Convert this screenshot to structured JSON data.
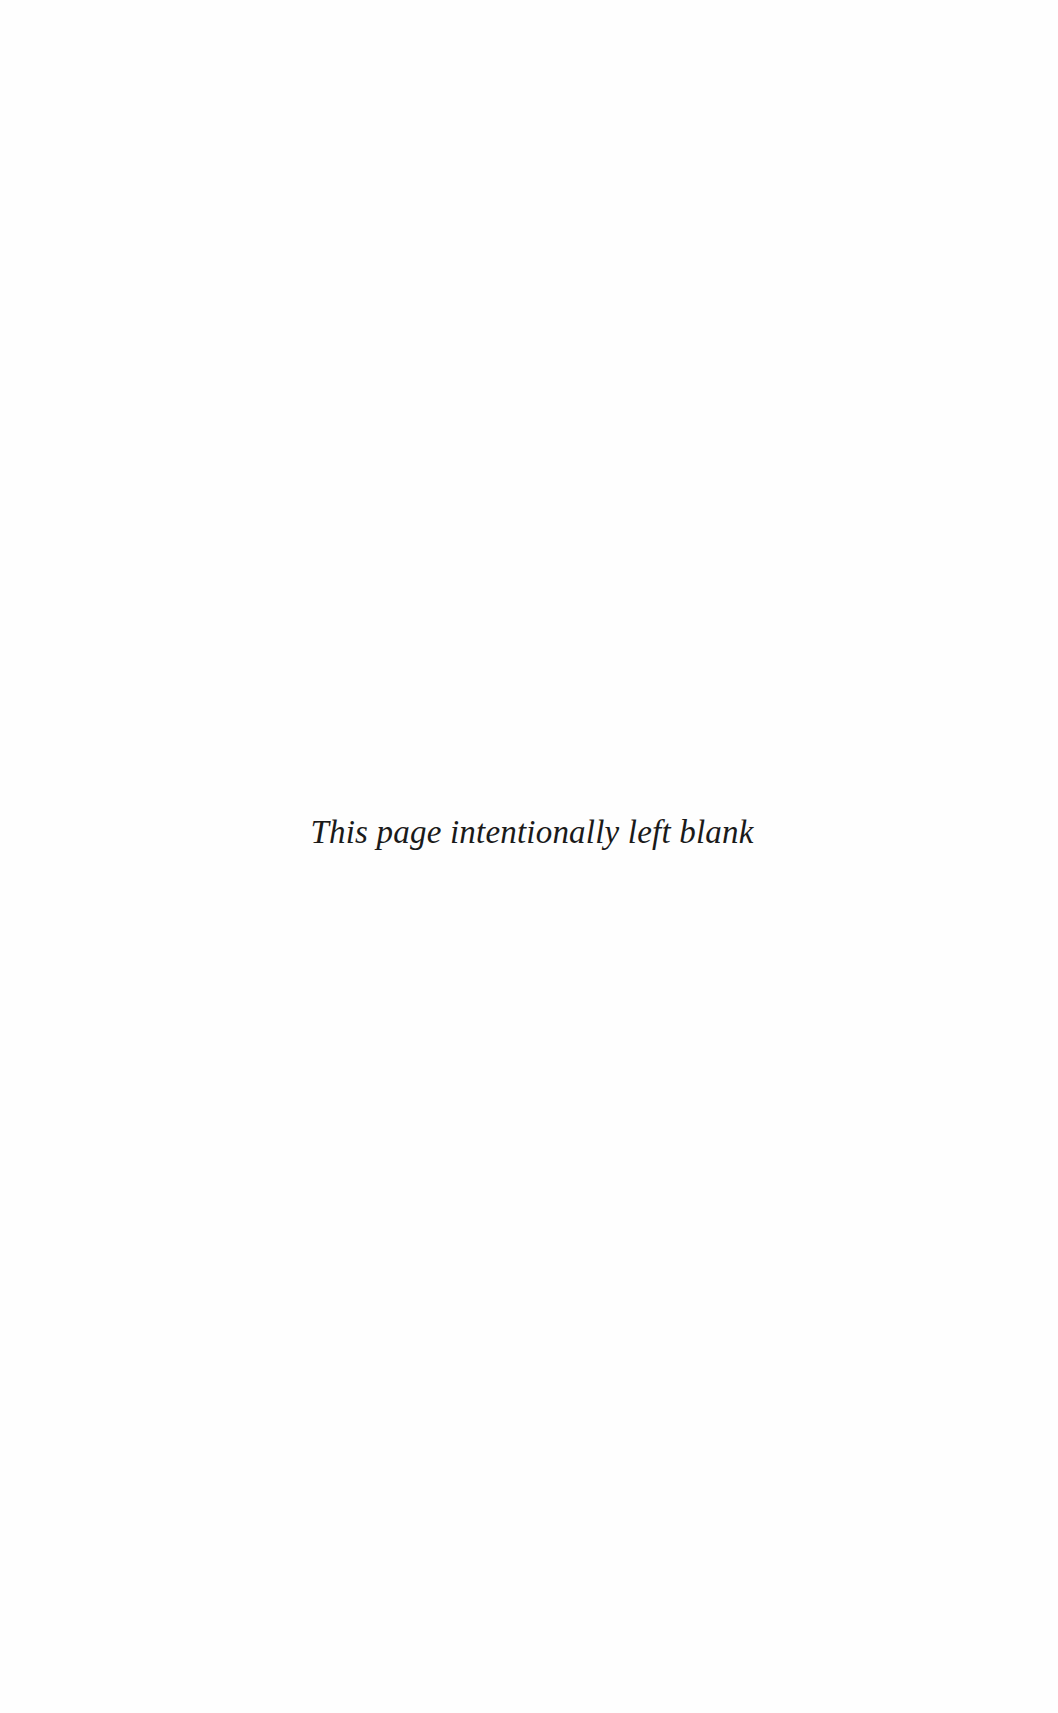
{
  "page": {
    "notice": "This page intentionally left blank",
    "background_color": "#fefefe",
    "text_color": "#1a1a1a"
  }
}
